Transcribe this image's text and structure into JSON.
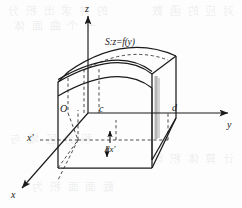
{
  "figure": {
    "caption_present": false,
    "background_color": "#fdfdfd",
    "ink_color": "#1a1a1a",
    "shade_color": "#9a9a9a"
  },
  "axes": {
    "z_label": "z",
    "y_label": "y",
    "x_label": "x",
    "x_prime_label": "x'",
    "origin_label": "O"
  },
  "marks": {
    "c_label": "c",
    "d_label": "d",
    "dx_label": "dx'"
  },
  "surface": {
    "label": "S:z=f(y)"
  },
  "ghost_text": {
    "line1": "的 并 求 出 积 分",
    "line2": "一 个 曲 面 体",
    "line3": "对 应 的 函 数",
    "line4": "积 分 区 域 与",
    "line5": "计 算 体 积 时",
    "line6": "截 面 面 积 为"
  }
}
